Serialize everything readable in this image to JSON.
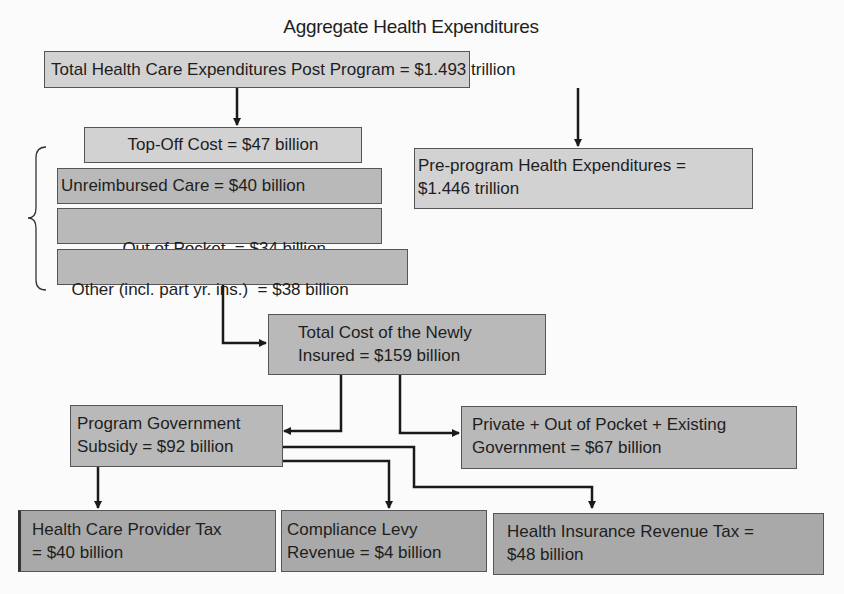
{
  "title": "Aggregate Health Expenditures",
  "boxes": {
    "total_post": {
      "line1": "Total Health Care Expenditures Post Program = $1.493 trillion"
    },
    "top_off": {
      "line1": "Top-Off Cost = $47 billion"
    },
    "unreimbursed": {
      "line1": "Unreimbursed Care = $40 billion"
    },
    "out_of_pocket": {
      "line1": "Out of Pocket  = $34 billion"
    },
    "other": {
      "line1": "Other (incl. part yr. ins.)  = $38 billion"
    },
    "pre_program": {
      "line1": "Pre-program Health Expenditures =",
      "line2": "$1.446 trillion"
    },
    "newly_insured": {
      "line1": "Total Cost of the Newly",
      "line2": "Insured = $159 billion"
    },
    "gov_subsidy": {
      "line1": "Program Government",
      "line2": "Subsidy = $92 billion"
    },
    "private_existing": {
      "line1": "Private + Out of Pocket + Existing",
      "line2": "Government = $67 billion"
    },
    "provider_tax": {
      "line1": "Health Care Provider Tax",
      "line2": "= $40 billion"
    },
    "compliance_levy": {
      "line1": "Compliance Levy",
      "line2": "Revenue = $4 billion"
    },
    "insurance_tax": {
      "line1": "Health Insurance Revenue Tax =",
      "line2": "$48 billion"
    }
  },
  "colors": {
    "light_box": "#d2d2d2",
    "mid_box": "#b9b9b9",
    "dark_box": "#a9a9a9",
    "line": "#1a1a1a"
  }
}
